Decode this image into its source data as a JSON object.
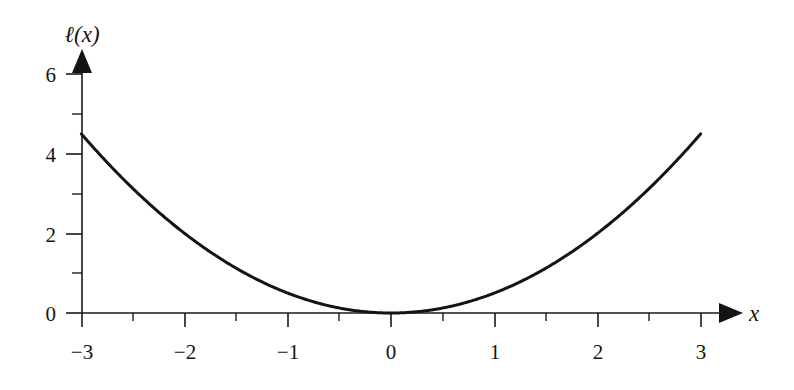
{
  "chart_data": {
    "type": "line",
    "title": "",
    "xlabel": "x",
    "ylabel": "ℓ(x)",
    "function": "ℓ(x) = 0.5x²",
    "xlim": [
      -3,
      3
    ],
    "ylim": [
      0,
      6
    ],
    "grid": false,
    "legend_position": "none",
    "x_major_ticks": [
      -3,
      -2,
      -1,
      0,
      1,
      2,
      3
    ],
    "x_major_tick_labels": [
      "−3",
      "−2",
      "−1",
      "0",
      "1",
      "2",
      "3"
    ],
    "x_minor_ticks": [
      -2.5,
      -1.5,
      -0.5,
      0.5,
      1.5,
      2.5
    ],
    "y_major_ticks": [
      0,
      2,
      4,
      6
    ],
    "y_major_tick_labels": [
      "0",
      "2",
      "4",
      "6"
    ],
    "y_minor_ticks": [
      1,
      3,
      5
    ],
    "x": [
      -3,
      -2.75,
      -2.5,
      -2.25,
      -2,
      -1.75,
      -1.5,
      -1.25,
      -1,
      -0.75,
      -0.5,
      -0.25,
      0,
      0.25,
      0.5,
      0.75,
      1,
      1.25,
      1.5,
      1.75,
      2,
      2.25,
      2.5,
      2.75,
      3
    ],
    "values": [
      4.5,
      3.78,
      3.13,
      2.53,
      2,
      1.53,
      1.13,
      0.78,
      0.5,
      0.28,
      0.13,
      0.03,
      0,
      0.03,
      0.13,
      0.28,
      0.5,
      0.78,
      1.13,
      1.53,
      2,
      2.53,
      3.13,
      3.78,
      4.5
    ],
    "series": [
      {
        "name": "ℓ(x) = 0.5x²",
        "values": [
          4.5,
          3.78,
          3.13,
          2.53,
          2,
          1.53,
          1.13,
          0.78,
          0.5,
          0.28,
          0.13,
          0.03,
          0,
          0.03,
          0.13,
          0.28,
          0.5,
          0.78,
          1.13,
          1.53,
          2,
          2.53,
          3.13,
          3.78,
          4.5
        ]
      }
    ],
    "annotations": [],
    "colors": {
      "curve": "#141414",
      "axis": "#1a1a1a",
      "text": "#141414",
      "background": "#ffffff"
    }
  },
  "axis_labels": {
    "y_axis_name": "ℓ(x)",
    "x_axis_name": "x"
  },
  "y_tick_labels": {
    "t0": "0",
    "t2": "2",
    "t4": "4",
    "t6": "6"
  },
  "x_tick_labels": {
    "m3": "−3",
    "m2": "−2",
    "m1": "−1",
    "z0": "0",
    "p1": "1",
    "p2": "2",
    "p3": "3"
  }
}
